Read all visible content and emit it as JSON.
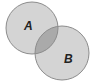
{
  "diagram": {
    "type": "venn",
    "sets": [
      {
        "label": "A",
        "cx": 32,
        "cy": 28,
        "r": 26
      },
      {
        "label": "B",
        "cx": 62,
        "cy": 53,
        "r": 27
      }
    ],
    "colors": {
      "fill": "#d3d3d3",
      "overlap": "#a9a9a9",
      "stroke": "#8a8a8a",
      "label": "#222222"
    }
  }
}
